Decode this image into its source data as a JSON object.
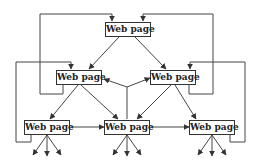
{
  "diagram": {
    "colors": {
      "line": "#444444",
      "box_border": "#333333",
      "text": "#222222",
      "background": "#ffffff"
    },
    "nodes": [
      {
        "id": "top",
        "label": "Web page"
      },
      {
        "id": "mid_left",
        "label": "Web page"
      },
      {
        "id": "mid_right",
        "label": "Web page"
      },
      {
        "id": "bottom_left",
        "label": "Web page"
      },
      {
        "id": "bottom_center",
        "label": "Web page"
      },
      {
        "id": "bottom_right",
        "label": "Web page"
      }
    ],
    "edges": [
      {
        "from": "top",
        "to": "mid_left"
      },
      {
        "from": "top",
        "to": "mid_right"
      },
      {
        "from": "mid_left",
        "to": "bottom_left"
      },
      {
        "from": "mid_left",
        "to": "bottom_center"
      },
      {
        "from": "mid_right",
        "to": "bottom_center"
      },
      {
        "from": "mid_right",
        "to": "bottom_right"
      },
      {
        "from": "bottom_left",
        "to": "bottom_center"
      },
      {
        "from": "bottom_center",
        "to": "bottom_right"
      },
      {
        "from": "bottom_center",
        "to": "mid_left"
      },
      {
        "from": "bottom_center",
        "to": "mid_right"
      },
      {
        "from": "mid_left",
        "to": "top"
      },
      {
        "from": "mid_right",
        "to": "top"
      },
      {
        "from": "bottom_left",
        "to": "mid_left"
      },
      {
        "from": "bottom_right",
        "to": "mid_right"
      }
    ],
    "outgoing_arrows_per_bottom_node": 3
  }
}
